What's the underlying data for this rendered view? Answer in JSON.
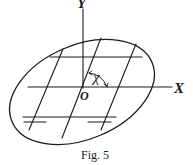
{
  "figure": {
    "caption": "Fig. 5",
    "axes": {
      "x_label": "X",
      "y_label": "Y",
      "origin_label": "O"
    },
    "angle_label": "χ",
    "elements": {
      "ellipse": "tilted closed curve (region)",
      "horizontal_lines": 3,
      "slanted_lines": 3,
      "short_double_segments": 2
    },
    "colors": {
      "ink": "#1a1a1a",
      "background": "#ffffff"
    }
  }
}
